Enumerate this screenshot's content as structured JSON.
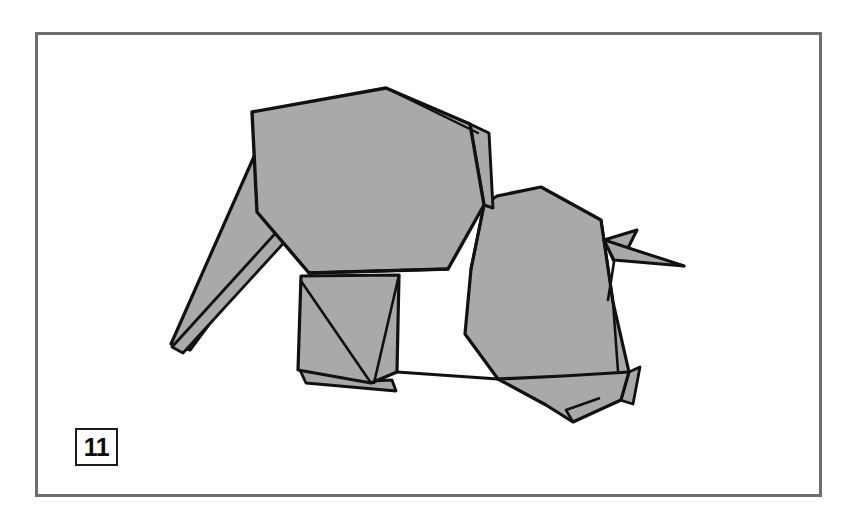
{
  "page": {
    "kind": "origami-instruction-diagram",
    "background_color": "#ffffff",
    "width": 856,
    "height": 526
  },
  "frame": {
    "name": "diagram-border",
    "stroke_color": "#6d6d6d",
    "stroke_width": 3,
    "x": 35,
    "y": 32,
    "width": 787,
    "height": 465,
    "fill": "#ffffff"
  },
  "step_badge": {
    "number": "11",
    "border_color": "#1b1b1b",
    "text_color": "#0d0d0d",
    "background_color": "#ffffff"
  },
  "model": {
    "subject": "folded paper elephant",
    "fill_color": "#a9a9a9",
    "outline_color": "#111111",
    "outline_width": 3.2,
    "crease_width": 2.6,
    "parts": [
      {
        "name": "head-panel",
        "role": "large front head flap",
        "points": "252,112 385,88 470,123 483,203 449,268 310,272 258,210"
      },
      {
        "name": "head-edge-sliver",
        "role": "thin folded edge right of head",
        "points": "470,123 487,131 492,206 483,203"
      },
      {
        "name": "trunk",
        "role": "tapering trunk pointing down-left",
        "points": "258,158 280,228 192,348 172,345"
      },
      {
        "name": "trunk-fold-sliver",
        "role": "narrow fold line along trunk",
        "points": "280,228 288,236 182,351 172,345"
      },
      {
        "name": "body-panel",
        "role": "main body / back",
        "points": "483,203 540,188 600,219 612,300 628,371 625,382 500,378 464,332 470,270"
      },
      {
        "name": "front-leg",
        "role": "foreleg below head",
        "points": "302,278 398,276 396,371 372,382 300,369"
      },
      {
        "name": "front-leg-underlayer",
        "role": "second layer of foreleg",
        "points": "300,369 372,382 384,381 390,389 307,381"
      },
      {
        "name": "hind-leg",
        "role": "rear leg",
        "points": "500,378 566,374 628,371 620,399 572,421 546,404"
      },
      {
        "name": "hind-leg-sliver",
        "role": "folded edge of rear leg",
        "points": "628,371 638,368 631,401 620,399"
      },
      {
        "name": "tail",
        "role": "pointed tail extending right",
        "points": "605,241 636,231 626,247 683,265 615,259"
      }
    ],
    "creases": [
      {
        "name": "head-to-body-crease",
        "points": "483,203 470,270"
      },
      {
        "name": "head-lower-crease",
        "points": "310,272 449,268"
      },
      {
        "name": "front-leg-inner-crease",
        "points": "302,278 372,382"
      },
      {
        "name": "front-leg-center-crease",
        "points": "398,276 372,382"
      },
      {
        "name": "belly-crease",
        "points": "396,371 500,378"
      },
      {
        "name": "body-back-crease",
        "points": "600,219 612,300"
      },
      {
        "name": "tail-base-crease",
        "points": "605,241 615,259"
      },
      {
        "name": "hind-leg-crease",
        "points": "612,300 620,399"
      },
      {
        "name": "trunk-root-crease",
        "points": "258,210 280,228"
      }
    ]
  }
}
